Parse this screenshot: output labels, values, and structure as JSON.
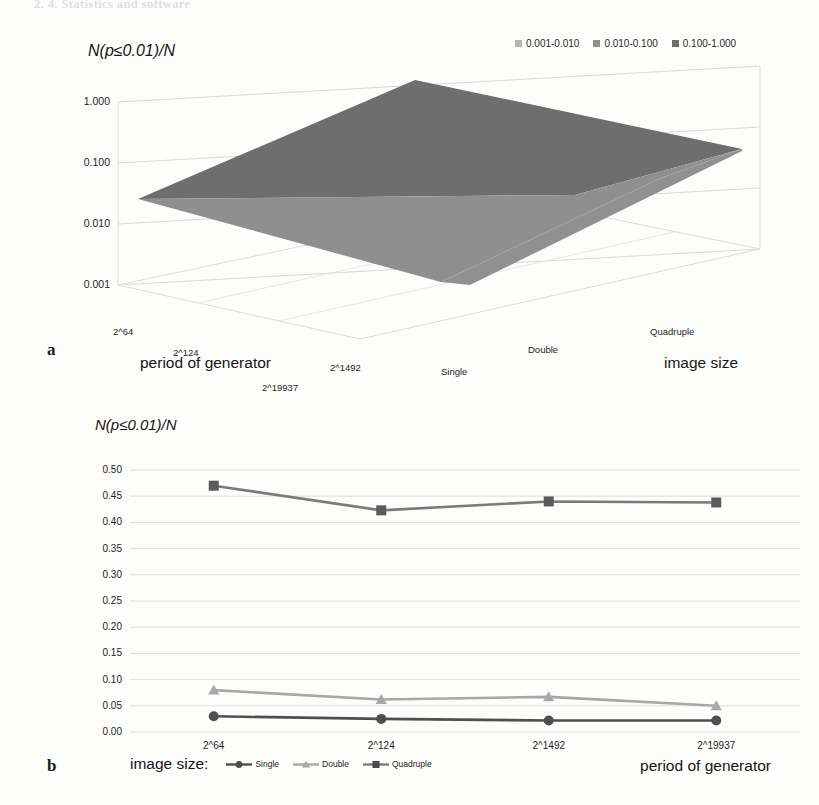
{
  "header": {
    "running_text": "2. 4. Statistics and software"
  },
  "panels": {
    "a": {
      "letter": "a"
    },
    "b": {
      "letter": "b"
    }
  },
  "colors": {
    "band_low": "#b4b4b4",
    "band_mid": "#8f8f8f",
    "band_high": "#6e6e6e",
    "single": "#4f4f4f",
    "double": "#a8a8a8",
    "quadruple": "#7a7a7a",
    "grid": "#d8d8d8",
    "text": "#1d1d1d"
  },
  "chart_data": [
    {
      "type": "heatmap",
      "id": "panel-a",
      "title": "",
      "ylabel": "N(p≤0.01)/N",
      "xlabel": "period of generator",
      "zlabel": "image size",
      "ytick_labels": [
        "1.000",
        "0.100",
        "0.010",
        "0.001"
      ],
      "ylim": [
        0.001,
        1.0
      ],
      "yscale": "log",
      "grid": true,
      "legend_position": "top-right",
      "legend": [
        {
          "label": "0.001-0.010",
          "color": "#b4b4b4"
        },
        {
          "label": "0.010-0.100",
          "color": "#8f8f8f"
        },
        {
          "label": "0.100-1.000",
          "color": "#6e6e6e"
        }
      ],
      "x_categories": [
        "2^64",
        "2^124",
        "2^1492",
        "2^19937"
      ],
      "z_categories": [
        "Single",
        "Double",
        "Quadruple"
      ],
      "series": [
        {
          "name": "Single",
          "values": [
            0.03,
            0.025,
            0.022,
            0.022
          ]
        },
        {
          "name": "Double",
          "values": [
            0.08,
            0.062,
            0.067,
            0.05
          ]
        },
        {
          "name": "Quadruple",
          "values": [
            0.47,
            0.423,
            0.44,
            0.438
          ]
        }
      ]
    },
    {
      "type": "line",
      "id": "panel-b",
      "title": "",
      "ylabel": "N(p≤0.01)/N",
      "xlabel": "period of generator",
      "legend_title": "image size:",
      "legend_position": "bottom",
      "grid": true,
      "ylim": [
        0.0,
        0.5
      ],
      "ytick_labels": [
        "0.00",
        "0.05",
        "0.10",
        "0.15",
        "0.20",
        "0.25",
        "0.30",
        "0.35",
        "0.40",
        "0.45",
        "0.50"
      ],
      "ytick_values": [
        0.0,
        0.05,
        0.1,
        0.15,
        0.2,
        0.25,
        0.3,
        0.35,
        0.4,
        0.45,
        0.5
      ],
      "categories": [
        "2^64",
        "2^124",
        "2^1492",
        "2^19937"
      ],
      "series": [
        {
          "name": "Single",
          "marker": "circle",
          "color": "#4f4f4f",
          "values": [
            0.03,
            0.025,
            0.022,
            0.022
          ]
        },
        {
          "name": "Double",
          "marker": "triangle",
          "color": "#a8a8a8",
          "values": [
            0.08,
            0.062,
            0.067,
            0.05
          ]
        },
        {
          "name": "Quadruple",
          "marker": "square",
          "color": "#7a7a7a",
          "values": [
            0.47,
            0.423,
            0.44,
            0.438
          ]
        }
      ]
    }
  ]
}
